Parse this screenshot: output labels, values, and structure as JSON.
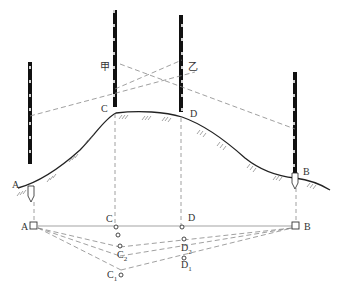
{
  "labels": {
    "A_top": "A",
    "B_top": "B",
    "C_top": "C",
    "D_top": "D",
    "jia": "甲",
    "yi": "乙",
    "A_bot": "A",
    "B_bot": "B",
    "C_bot": "C",
    "D_bot": "D",
    "C2": "C",
    "C2_sub": "2",
    "C1": "C",
    "C1_sub": "1",
    "D2": "D",
    "D2_sub": "2",
    "D1": "D",
    "D1_sub": "1"
  },
  "colors": {
    "line": "#222222",
    "dash": "#888888",
    "rod": "#111111"
  }
}
